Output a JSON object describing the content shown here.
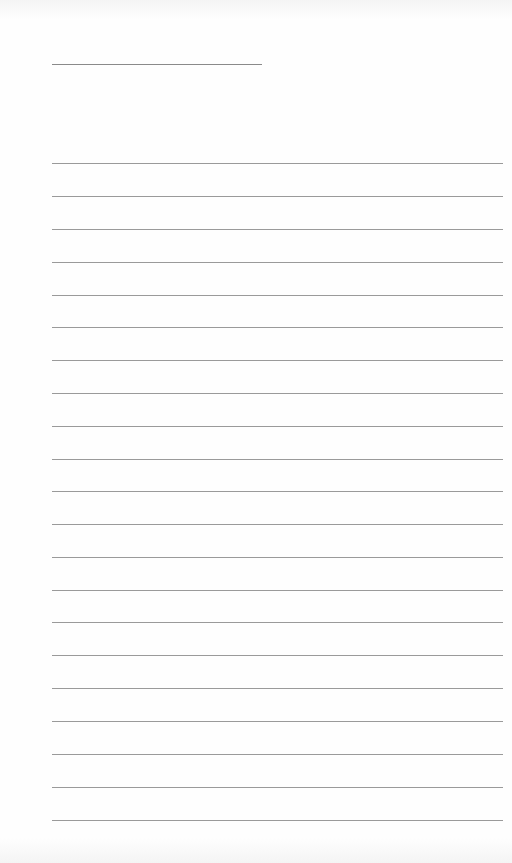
{
  "document": {
    "type": "lined-writing-sheet",
    "title_line": {
      "x": 52,
      "y": 64,
      "width": 210
    },
    "rules": {
      "left": 52,
      "width": 451,
      "positions": [
        163,
        196,
        229,
        262,
        295,
        327,
        360,
        393,
        426,
        459,
        491,
        524,
        557,
        590,
        622,
        655,
        688,
        721,
        754,
        787,
        820
      ]
    },
    "colors": {
      "paper": "#fefefe",
      "rule": "#9a9a9a",
      "title_rule": "#8a8a8a"
    }
  }
}
